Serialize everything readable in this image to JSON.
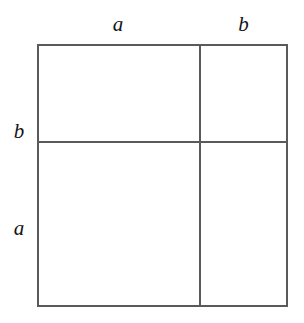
{
  "figure": {
    "background_color": "#ffffff",
    "line_color": "#5a5a5a",
    "text_color": "#141414"
  },
  "labels": {
    "top": [
      {
        "id": "top-a",
        "text": "a",
        "segment": "top-left",
        "style": "italic"
      },
      {
        "id": "top-b",
        "text": "b",
        "segment": "top-right",
        "style": "italic"
      }
    ],
    "left": [
      {
        "id": "left-b",
        "text": "b",
        "segment": "left-upper",
        "style": "italic"
      },
      {
        "id": "left-a",
        "text": "a",
        "segment": "left-lower",
        "style": "italic"
      }
    ]
  },
  "regions": [
    {
      "id": "region-top-left",
      "width_label": "a",
      "height_label": "b",
      "fill": "none"
    },
    {
      "id": "region-top-right",
      "width_label": "b",
      "height_label": "b",
      "fill": "none"
    },
    {
      "id": "region-bottom-left",
      "width_label": "a",
      "height_label": "a",
      "fill": "none"
    },
    {
      "id": "region-bottom-right",
      "width_label": "b",
      "height_label": "a",
      "fill": "none"
    }
  ],
  "geometry": {
    "square": {
      "x": 37,
      "y": 44,
      "width": 251,
      "height": 263
    },
    "vertical_divider_x": 199,
    "horizontal_divider_y": 141,
    "column_widths": [
      162,
      89
    ],
    "row_heights": [
      98,
      165
    ],
    "line_width_px": 2
  }
}
